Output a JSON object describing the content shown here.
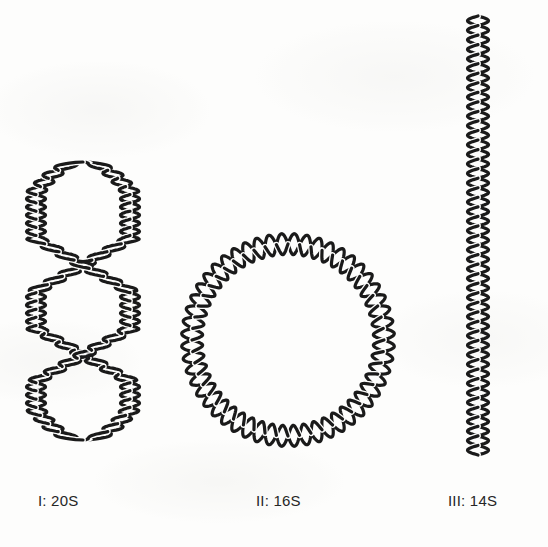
{
  "figure": {
    "background_color": "#fdfdfc",
    "stroke_color": "#1a1a1a",
    "label_color": "#262626",
    "width": 548,
    "height": 547
  },
  "forms": [
    {
      "id": "form-i",
      "label": "I: 20S",
      "topology": "supercoiled",
      "sedimentation_coefficient": "20S",
      "roman_numeral": "I",
      "label_x": 38,
      "label_y": 492,
      "geometry": {
        "shape": "supercoiled-loop",
        "center_x": 83,
        "top_y": 162,
        "bottom_y": 440,
        "lobe_half_width": 47,
        "crossing_y": [
          265,
          355
        ],
        "stroke_width": 3.2,
        "helix_turns": 34,
        "amplitude": 9.5
      }
    },
    {
      "id": "form-ii",
      "label": "II: 16S",
      "topology": "relaxed-circle",
      "sedimentation_coefficient": "16S",
      "roman_numeral": "II",
      "label_x": 256,
      "label_y": 492,
      "geometry": {
        "shape": "circle",
        "center_x": 288,
        "center_y": 340,
        "radius": 96,
        "stroke_width": 3.2,
        "helix_turns": 26,
        "amplitude": 10.5
      }
    },
    {
      "id": "form-iii",
      "label": "III: 14S",
      "topology": "linear",
      "sedimentation_coefficient": "14S",
      "roman_numeral": "III",
      "label_x": 448,
      "label_y": 492,
      "geometry": {
        "shape": "line",
        "center_x": 478,
        "top_y": 16,
        "bottom_y": 455,
        "stroke_width": 3.2,
        "helix_turns": 23,
        "amplitude": 10.5
      }
    }
  ]
}
